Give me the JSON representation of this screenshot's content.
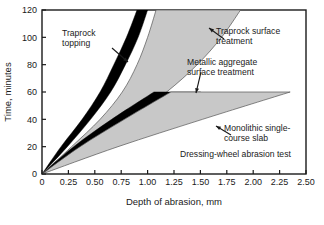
{
  "chart_data": {
    "type": "area",
    "title": "",
    "xlabel": "Depth of abrasion, mm",
    "ylabel": "Time, minutes",
    "xlim": [
      0,
      2.5
    ],
    "ylim": [
      0,
      120
    ],
    "xticks": [
      "0",
      "0.25",
      "0.50",
      "0.75",
      "1.00",
      "1.25",
      "1.50",
      "1.75",
      "2.00",
      "2.25",
      "2.50"
    ],
    "xtick_values": [
      0,
      0.25,
      0.5,
      0.75,
      1.0,
      1.25,
      1.5,
      1.75,
      2.0,
      2.25,
      2.5
    ],
    "yticks": [
      "0",
      "20",
      "40",
      "60",
      "80",
      "100",
      "120"
    ],
    "ytick_values": [
      0,
      20,
      40,
      60,
      80,
      100,
      120
    ],
    "grid": false,
    "legend_position": "inline-annotations",
    "note": "Dressing-wheel abrasion test",
    "series": [
      {
        "name": "Traprock topping",
        "fill": "#000000",
        "band_label": "Traprock topping",
        "lower_xy": [
          [
            0,
            0
          ],
          [
            0.18,
            20
          ],
          [
            0.38,
            40
          ],
          [
            0.55,
            60
          ],
          [
            0.68,
            80
          ],
          [
            0.8,
            100
          ],
          [
            0.9,
            120
          ]
        ],
        "upper_xy": [
          [
            0,
            0
          ],
          [
            0.24,
            20
          ],
          [
            0.46,
            40
          ],
          [
            0.65,
            60
          ],
          [
            0.79,
            80
          ],
          [
            0.91,
            100
          ],
          [
            1.0,
            120
          ]
        ]
      },
      {
        "name": "Traprock surface treatment",
        "fill": "#c8c8c8",
        "band_label": "Traprock surface treatment",
        "lower_xy": [
          [
            0,
            0
          ],
          [
            0.28,
            20
          ],
          [
            0.55,
            40
          ],
          [
            0.76,
            60
          ],
          [
            0.9,
            80
          ],
          [
            1.0,
            100
          ],
          [
            1.08,
            120
          ]
        ],
        "upper_xy": [
          [
            0,
            0
          ],
          [
            0.4,
            20
          ],
          [
            0.82,
            40
          ],
          [
            1.18,
            60
          ],
          [
            1.47,
            80
          ],
          [
            1.7,
            100
          ],
          [
            1.88,
            120
          ]
        ]
      },
      {
        "name": "Metallic aggregate surface treatment",
        "fill": "#000000",
        "band_label": "Metallic aggregate surface treatment",
        "lower_xy": [
          [
            0,
            0
          ],
          [
            0.3,
            20
          ],
          [
            0.66,
            40
          ],
          [
            1.06,
            60
          ]
        ],
        "upper_xy": [
          [
            0,
            0
          ],
          [
            0.44,
            20
          ],
          [
            0.96,
            40
          ],
          [
            1.5,
            60
          ]
        ]
      },
      {
        "name": "Monolithic single-course slab",
        "fill": "#c8c8c8",
        "band_label": "Monolithic single-course slab",
        "lower_xy": [
          [
            0,
            0
          ],
          [
            0.36,
            20
          ],
          [
            0.78,
            40
          ],
          [
            1.22,
            60
          ]
        ],
        "upper_xy": [
          [
            0,
            0
          ],
          [
            0.72,
            20
          ],
          [
            1.52,
            40
          ],
          [
            2.35,
            60
          ]
        ]
      }
    ],
    "annotations": [
      {
        "id": "traprock-topping",
        "text_line1": "Traprock",
        "text_line2": "topping",
        "x_px": 62,
        "y_px": 36,
        "arrow_from": [
          112,
          48
        ],
        "arrow_to": [
          128,
          62
        ]
      },
      {
        "id": "traprock-surface",
        "text_line1": "Traprock surface",
        "text_line2": "treatment",
        "x_px": 216,
        "y_px": 34,
        "arrow_from": [
          224,
          39
        ],
        "arrow_to": [
          209,
          28
        ]
      },
      {
        "id": "metallic-aggregate",
        "text_line1": "Metallic aggregate",
        "text_line2": "surface treatment",
        "x_px": 187,
        "y_px": 65,
        "arrow_from": [
          201,
          72
        ],
        "arrow_to": [
          196,
          93
        ]
      },
      {
        "id": "monolithic-slab",
        "text_line1": "Monolithic single-",
        "text_line2": "course slab",
        "x_px": 224,
        "y_px": 131,
        "arrow_from": [
          231,
          135
        ],
        "arrow_to": [
          216,
          126
        ]
      },
      {
        "id": "test-note",
        "text_line1": "Dressing-wheel abrasion test",
        "text_line2": "",
        "x_px": 180,
        "y_px": 157,
        "arrow_from": null,
        "arrow_to": null
      }
    ]
  },
  "colors": {
    "axis": "#1a1a1a",
    "black_band": "#000000",
    "gray_band": "#c8c8c8",
    "gray_band_edge": "#555555",
    "background": "#ffffff"
  },
  "geometry": {
    "plot_left_px": 42,
    "plot_right_px": 306,
    "plot_top_px": 10,
    "plot_bottom_px": 174
  }
}
